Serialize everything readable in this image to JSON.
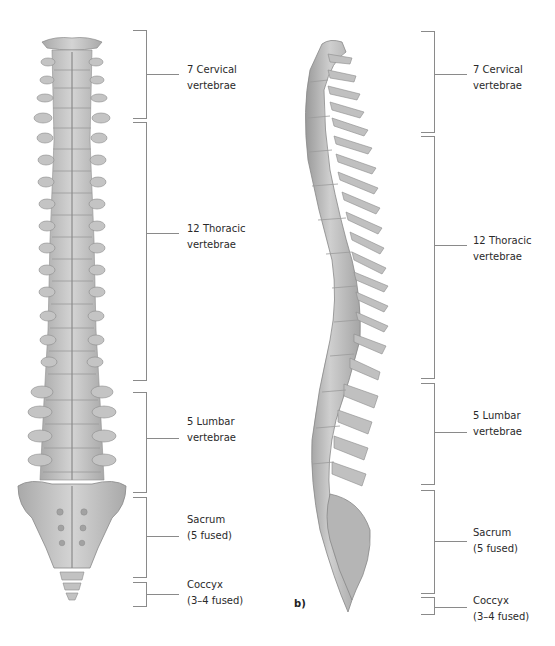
{
  "figure": {
    "panel_b_label": "b)",
    "colors": {
      "bone": "#bdbdbd",
      "bone_dark": "#8f8f8f",
      "bone_light": "#dcdcdc",
      "bracket": "#8a8a8a",
      "text": "#2a2a2a"
    }
  },
  "panel_a": {
    "view": "anterior",
    "regions": [
      {
        "id": "cervical",
        "line1": "7 Cervical",
        "line2": "vertebrae",
        "top": 30,
        "bottom": 118
      },
      {
        "id": "thoracic",
        "line1": "12 Thoracic",
        "line2": "vertebrae",
        "top": 122,
        "bottom": 380
      },
      {
        "id": "lumbar",
        "line1": "5 Lumbar",
        "line2": "vertebrae",
        "top": 392,
        "bottom": 492
      },
      {
        "id": "sacrum",
        "line1": "Sacrum",
        "line2": "(5 fused)",
        "top": 497,
        "bottom": 577
      },
      {
        "id": "coccyx",
        "line1": "Coccyx",
        "line2": "(3–4 fused)",
        "top": 582,
        "bottom": 606
      }
    ]
  },
  "panel_b": {
    "view": "lateral",
    "regions": [
      {
        "id": "cervical",
        "line1": "7 Cervical",
        "line2": "vertebrae",
        "top": 31,
        "bottom": 132
      },
      {
        "id": "thoracic",
        "line1": "12 Thoracic",
        "line2": "vertebrae",
        "top": 136,
        "bottom": 378
      },
      {
        "id": "lumbar",
        "line1": "5 Lumbar",
        "line2": "vertebrae",
        "top": 383,
        "bottom": 484
      },
      {
        "id": "sacrum",
        "line1": "Sacrum",
        "line2": "(5 fused)",
        "top": 490,
        "bottom": 593
      },
      {
        "id": "coccyx",
        "line1": "Coccyx",
        "line2": "(3–4 fused)",
        "top": 597,
        "bottom": 614
      }
    ]
  }
}
